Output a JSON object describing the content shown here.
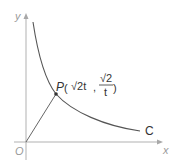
{
  "axes": {
    "x_label": "x",
    "y_label": "y",
    "origin_label": "O"
  },
  "curve": {
    "label": "C",
    "equation": "xy = 2 (hyperbola, first quadrant)",
    "color": "#555555"
  },
  "point": {
    "label": "P",
    "x_coord": "√2t",
    "y_num": "√2",
    "y_den": "t",
    "comma": ","
  },
  "colors": {
    "axis": "#a0a0a0",
    "curve": "#555555",
    "segment": "#666666"
  }
}
